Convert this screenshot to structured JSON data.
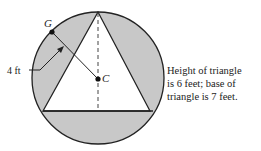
{
  "diagram": {
    "labels": {
      "point_g": "G",
      "point_c": "C",
      "radius": "4 ft"
    },
    "caption": [
      "Height of triangle",
      "is 6 feet; base of",
      "triangle is 7 feet."
    ],
    "colors": {
      "shade": "#c8c8c8",
      "stroke": "#222222"
    }
  }
}
